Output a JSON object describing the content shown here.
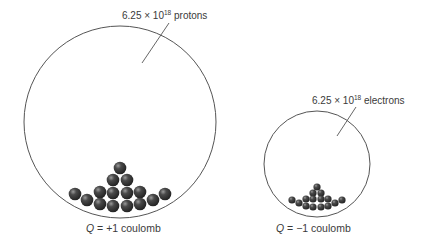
{
  "diagram": {
    "left": {
      "label_prefix": "6.25 × 10",
      "label_exponent": "18",
      "label_suffix": " protons",
      "caption_var": "Q",
      "caption_rest": " = +1 coulomb",
      "circle": {
        "cx": 120,
        "cy": 122,
        "r": 96
      },
      "particle_count_shown": 15
    },
    "right": {
      "label_prefix": "6.25 × 10",
      "label_exponent": "18",
      "label_suffix": " electrons",
      "caption_var": "Q",
      "caption_rest": " = −1 coulomb",
      "circle": {
        "cx": 317,
        "cy": 164,
        "r": 53
      },
      "particle_count_shown": 15
    },
    "colors": {
      "outline": "#555555",
      "particle": "#3a3a3a",
      "text": "#3a3a3a"
    }
  }
}
